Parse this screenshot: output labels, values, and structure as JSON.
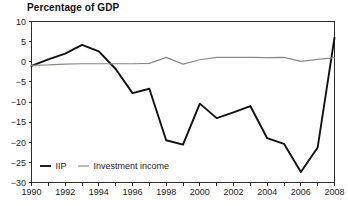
{
  "chart_data": {
    "type": "line",
    "title": "Percentage of GDP",
    "xlabel": "",
    "ylabel": "",
    "xlim": [
      1990,
      2008
    ],
    "ylim": [
      -30,
      10
    ],
    "ytick_values": [
      10,
      5,
      0,
      -5,
      -10,
      -15,
      -20,
      -25,
      -30
    ],
    "ytick_labels": [
      "10",
      "5",
      "0",
      "−5",
      "−10",
      "−15",
      "−20",
      "−25",
      "−30"
    ],
    "xtick_values": [
      1990,
      1991,
      1992,
      1993,
      1994,
      1995,
      1996,
      1997,
      1998,
      1999,
      2000,
      2001,
      2002,
      2003,
      2004,
      2005,
      2006,
      2007,
      2008
    ],
    "xtick_labels_shown": [
      "1990",
      "1992",
      "1994",
      "1996",
      "1998",
      "2000",
      "2002",
      "2004",
      "2006",
      "2008"
    ],
    "grid": false,
    "legend_position": "bottom-left",
    "x": [
      1990,
      1991,
      1992,
      1993,
      1994,
      1995,
      1996,
      1997,
      1998,
      1999,
      2000,
      2001,
      2002,
      2003,
      2004,
      2005,
      2006,
      2007,
      2008
    ],
    "series": [
      {
        "name": "IIP",
        "color": "#111111",
        "values": [
          -1.0,
          0.6,
          2.0,
          4.2,
          2.6,
          -1.8,
          -7.8,
          -6.7,
          -19.5,
          -20.6,
          -10.4,
          -14.0,
          -12.6,
          -11.0,
          -19.0,
          -20.4,
          -27.4,
          -21.3,
          6.0
        ]
      },
      {
        "name": "Investment income",
        "color": "#8a8a85",
        "values": [
          -0.9,
          -0.8,
          -0.6,
          -0.5,
          -0.5,
          -0.5,
          -0.5,
          -0.4,
          1.1,
          -0.6,
          0.5,
          1.1,
          1.1,
          1.1,
          1.0,
          1.1,
          0.1,
          0.6,
          1.0
        ]
      }
    ],
    "legend": [
      {
        "label": "IIP",
        "color": "#111111"
      },
      {
        "label": "Investment income",
        "color": "#8a8a85"
      }
    ]
  }
}
